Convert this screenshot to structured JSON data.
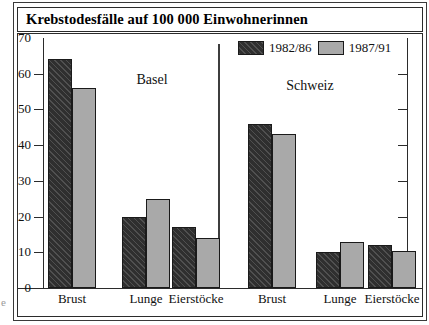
{
  "title": "Krebstodesfälle auf 100 000 Einwohnerinnen",
  "edge_mark": "e",
  "legend": {
    "position": "top-center-right",
    "entries": [
      {
        "label": "1982/86",
        "style": "dark-hatched",
        "color": "#2f2f2f"
      },
      {
        "label": "1987/91",
        "style": "light-solid",
        "color": "#a9a9a9"
      }
    ]
  },
  "panels": [
    {
      "name": "Basel"
    },
    {
      "name": "Schweiz"
    }
  ],
  "axis": {
    "yticks": [
      0,
      10,
      20,
      30,
      40,
      50,
      60,
      70
    ],
    "ylim": [
      0,
      70
    ],
    "grid": false,
    "right_ticks_unlabeled": true
  },
  "chart_data": {
    "type": "bar",
    "title": "Krebstodesfälle auf 100 000 Einwohnerinnen",
    "xlabel": "",
    "ylabel": "",
    "ylim": [
      0,
      70
    ],
    "yticks": [
      0,
      10,
      20,
      30,
      40,
      50,
      60,
      70
    ],
    "grid": false,
    "legend_position": "top-center",
    "panels": [
      "Basel",
      "Schweiz"
    ],
    "categories": [
      "Brust",
      "Lunge",
      "Eierstöcke",
      "Brust",
      "Lunge",
      "Eierstöcke"
    ],
    "series": [
      {
        "name": "1982/86",
        "color": "#2f2f2f",
        "values": [
          64,
          20,
          17,
          46,
          10,
          12
        ]
      },
      {
        "name": "1987/91",
        "color": "#a9a9a9",
        "values": [
          56,
          25,
          14,
          43,
          13,
          10.5
        ]
      }
    ],
    "groups": [
      {
        "panel": "Basel",
        "category": "Brust",
        "1982/86": 64,
        "1987/91": 56
      },
      {
        "panel": "Basel",
        "category": "Lunge",
        "1982/86": 20,
        "1987/91": 25
      },
      {
        "panel": "Basel",
        "category": "Eierstöcke",
        "1982/86": 17,
        "1987/91": 14
      },
      {
        "panel": "Schweiz",
        "category": "Brust",
        "1982/86": 46,
        "1987/91": 43
      },
      {
        "panel": "Schweiz",
        "category": "Lunge",
        "1982/86": 10,
        "1987/91": 13
      },
      {
        "panel": "Schweiz",
        "category": "Eierstöcke",
        "1982/86": 12,
        "1987/91": 10.5
      }
    ]
  }
}
